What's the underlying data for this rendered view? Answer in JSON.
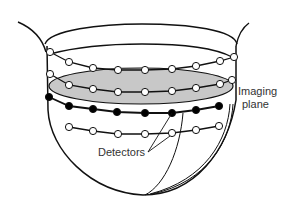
{
  "diagram": {
    "labels": {
      "imaging_plane_line1": "Imaging",
      "imaging_plane_line2": "plane",
      "detectors": "Detectors"
    },
    "colors": {
      "line": "#111111",
      "plane_fill": "#c8c8c8",
      "open_detector": "#ffffff",
      "filled_detector": "#000000",
      "text": "#333333"
    },
    "rows": [
      {
        "name": "row-1-open",
        "type": "open",
        "points": [
          [
            50,
            52
          ],
          [
            69,
            62
          ],
          [
            93,
            68
          ],
          [
            118,
            70
          ],
          [
            145,
            70
          ],
          [
            172,
            69
          ],
          [
            196,
            66
          ],
          [
            220,
            61
          ],
          [
            234,
            57
          ]
        ]
      },
      {
        "name": "row-2-open",
        "type": "open",
        "points": [
          [
            50,
            74
          ],
          [
            69,
            85
          ],
          [
            93,
            89
          ],
          [
            118,
            92
          ],
          [
            145,
            92
          ],
          [
            172,
            91
          ],
          [
            196,
            88
          ],
          [
            220,
            84
          ],
          [
            232,
            80
          ]
        ]
      },
      {
        "name": "row-3-filled",
        "type": "filled",
        "points": [
          [
            49,
            97
          ],
          [
            69,
            106
          ],
          [
            93,
            109
          ],
          [
            117,
            112
          ],
          [
            145,
            113
          ],
          [
            172,
            113
          ],
          [
            196,
            110
          ],
          [
            219,
            106
          ]
        ]
      },
      {
        "name": "row-4-open",
        "type": "open",
        "points": [
          [
            69,
            127
          ],
          [
            93,
            131
          ],
          [
            118,
            134
          ],
          [
            145,
            134
          ],
          [
            172,
            133
          ],
          [
            196,
            130
          ],
          [
            219,
            126
          ]
        ]
      }
    ]
  }
}
